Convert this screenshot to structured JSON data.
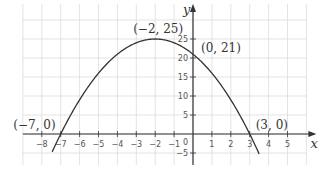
{
  "chart_data": {
    "type": "line",
    "title": "",
    "xlabel": "x",
    "ylabel": "y",
    "xlim": [
      -9,
      6
    ],
    "ylim": [
      -7.5,
      30
    ],
    "grid": true,
    "x_ticks": [
      -8,
      -7,
      -6,
      -5,
      -4,
      -3,
      -2,
      -1,
      1,
      2,
      3,
      4,
      5
    ],
    "y_ticks": [
      -5,
      5,
      10,
      15,
      20,
      25
    ],
    "origin_label": "0",
    "function": "y = -(x + 2)^2 + 25",
    "series": [
      {
        "name": "parabola",
        "x": [
          -7.4,
          -7,
          -6,
          -5,
          -4,
          -3,
          -2,
          -1,
          0,
          1,
          2,
          3,
          3.5
        ],
        "y": [
          -4.16,
          0,
          9,
          16,
          21,
          24,
          25,
          24,
          21,
          16,
          9,
          0,
          -5.25
        ]
      }
    ],
    "annotations": [
      {
        "text": "(−2, 25)",
        "x": -2,
        "y": 25
      },
      {
        "text": "(0, 21)",
        "x": 0,
        "y": 21
      },
      {
        "text": "(−7, 0)",
        "x": -7,
        "y": 0
      },
      {
        "text": "(3, 0)",
        "x": 3,
        "y": 0
      }
    ]
  },
  "colors": {
    "grid": "#dcdcdc",
    "axis": "#333333",
    "curve": "#333333"
  }
}
